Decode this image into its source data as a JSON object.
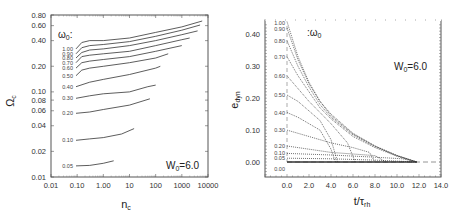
{
  "chart_data": [
    {
      "type": "line",
      "title": "",
      "xlabel": "n_c",
      "ylabel": "Ω_c",
      "xscale": "log",
      "yscale": "log",
      "xlim": [
        0.01,
        10000
      ],
      "ylim": [
        0.01,
        0.8
      ],
      "xticks": [
        "0.01",
        "0.10",
        "1.00",
        "10",
        "100",
        "1000",
        "10000"
      ],
      "yticks": [
        "0.01",
        "0.02",
        "0.04",
        "0.06",
        "0.08",
        "0.10",
        "0.20",
        "0.40",
        "0.60",
        "0.80"
      ],
      "legend_title": "ω0:",
      "annotation": "W0=6.0",
      "grid": false,
      "series": [
        {
          "name": "1.00",
          "x": [
            0.09,
            0.15,
            0.3,
            1,
            10,
            100,
            1000,
            6000
          ],
          "y": [
            0.32,
            0.38,
            0.4,
            0.4,
            0.43,
            0.5,
            0.58,
            0.68
          ]
        },
        {
          "name": "0.90",
          "x": [
            0.09,
            0.15,
            0.3,
            1,
            10,
            100,
            1000,
            5000
          ],
          "y": [
            0.28,
            0.33,
            0.35,
            0.36,
            0.39,
            0.45,
            0.53,
            0.61
          ]
        },
        {
          "name": "0.80",
          "x": [
            0.09,
            0.15,
            0.3,
            1,
            10,
            100,
            1000,
            4000
          ],
          "y": [
            0.25,
            0.29,
            0.31,
            0.32,
            0.35,
            0.4,
            0.47,
            0.52
          ]
        },
        {
          "name": "0.70",
          "x": [
            0.09,
            0.15,
            0.3,
            1,
            10,
            100,
            1000,
            2000
          ],
          "y": [
            0.22,
            0.26,
            0.27,
            0.28,
            0.3,
            0.35,
            0.41,
            0.43
          ]
        },
        {
          "name": "0.60",
          "x": [
            0.09,
            0.15,
            0.3,
            1,
            10,
            100,
            1000
          ],
          "y": [
            0.19,
            0.22,
            0.23,
            0.24,
            0.26,
            0.3,
            0.35
          ]
        },
        {
          "name": "0.50",
          "x": [
            0.09,
            0.15,
            0.3,
            1,
            10,
            100,
            300
          ],
          "y": [
            0.155,
            0.18,
            0.19,
            0.2,
            0.22,
            0.25,
            0.28
          ]
        },
        {
          "name": "0.40",
          "x": [
            0.09,
            0.3,
            1,
            10,
            100,
            150
          ],
          "y": [
            0.115,
            0.13,
            0.14,
            0.16,
            0.19,
            0.2
          ]
        },
        {
          "name": "0.30",
          "x": [
            0.09,
            0.3,
            1,
            10,
            50,
            100
          ],
          "y": [
            0.084,
            0.09,
            0.095,
            0.1,
            0.115,
            0.12
          ]
        },
        {
          "name": "0.20",
          "x": [
            0.09,
            0.3,
            1,
            10,
            60
          ],
          "y": [
            0.056,
            0.058,
            0.062,
            0.07,
            0.083
          ]
        },
        {
          "name": "0.10",
          "x": [
            0.09,
            0.3,
            1,
            5,
            15
          ],
          "y": [
            0.027,
            0.028,
            0.029,
            0.032,
            0.037
          ]
        },
        {
          "name": "0.05",
          "x": [
            0.09,
            0.3,
            1,
            2.5
          ],
          "y": [
            0.0135,
            0.0137,
            0.0145,
            0.0155
          ]
        }
      ]
    },
    {
      "type": "line",
      "title": "",
      "xlabel": "t/τ_rh",
      "ylabel": "e_dyn",
      "xlim": [
        -2,
        14
      ],
      "ylim": [
        -0.047,
        0.445
      ],
      "xticks": [
        "0.0",
        "2.0",
        "4.0",
        "6.0",
        "8.0",
        "10.0",
        "12.0",
        "14.0"
      ],
      "yticks": [
        "0.00",
        "0.10",
        "0.20",
        "0.30",
        "0.40"
      ],
      "legend_title": ":ω0",
      "annotation": "W0=6.0",
      "grid": false,
      "line_style": "dotted",
      "series": [
        {
          "name": "1.00",
          "x": [
            0,
            1,
            2,
            3,
            4,
            6,
            8,
            10,
            11.8
          ],
          "y": [
            0.44,
            0.33,
            0.25,
            0.19,
            0.15,
            0.09,
            0.05,
            0.02,
            0.0
          ]
        },
        {
          "name": "0.90",
          "x": [
            0,
            1,
            2,
            3,
            4,
            6,
            8,
            10,
            11.8
          ],
          "y": [
            0.42,
            0.32,
            0.245,
            0.19,
            0.145,
            0.088,
            0.05,
            0.02,
            0.0
          ]
        },
        {
          "name": "0.80",
          "x": [
            0,
            1,
            2,
            3,
            4,
            6,
            8,
            10,
            11.8
          ],
          "y": [
            0.38,
            0.3,
            0.235,
            0.18,
            0.14,
            0.085,
            0.048,
            0.02,
            0.0
          ]
        },
        {
          "name": "0.70",
          "x": [
            0,
            1,
            2,
            3,
            4,
            6,
            8,
            10,
            11.8
          ],
          "y": [
            0.33,
            0.27,
            0.22,
            0.17,
            0.135,
            0.08,
            0.045,
            0.018,
            0.0
          ]
        },
        {
          "name": "0.60",
          "x": [
            0,
            1,
            2,
            3,
            4,
            5.5,
            6.2
          ],
          "y": [
            0.27,
            0.23,
            0.19,
            0.155,
            0.12,
            0.06,
            0.0
          ]
        },
        {
          "name": "0.50",
          "x": [
            0,
            1,
            2,
            3,
            4,
            4.6
          ],
          "y": [
            0.21,
            0.19,
            0.16,
            0.13,
            0.07,
            0.0
          ]
        },
        {
          "name": "0.40",
          "x": [
            0,
            1,
            2,
            3,
            4,
            4.4
          ],
          "y": [
            0.155,
            0.14,
            0.12,
            0.1,
            0.04,
            0.0
          ]
        },
        {
          "name": "0.30",
          "x": [
            0,
            2,
            4,
            6,
            7.5,
            8.0
          ],
          "y": [
            0.1,
            0.08,
            0.06,
            0.045,
            0.03,
            0.0
          ]
        },
        {
          "name": "0.20",
          "x": [
            0,
            2,
            4,
            6,
            8,
            9.0
          ],
          "y": [
            0.05,
            0.04,
            0.03,
            0.025,
            0.02,
            0.0
          ]
        },
        {
          "name": "0.10",
          "x": [
            0,
            4,
            8,
            10.5,
            11.8
          ],
          "y": [
            0.027,
            0.022,
            0.015,
            0.01,
            0.0
          ]
        },
        {
          "name": "0.05",
          "x": [
            0,
            4,
            8,
            11.8
          ],
          "y": [
            0.012,
            0.01,
            0.006,
            0.0
          ]
        },
        {
          "name": "0.00",
          "x": [
            0,
            11.8
          ],
          "y": [
            0.0,
            0.0
          ]
        }
      ],
      "reference_lines": [
        {
          "orientation": "horizontal",
          "y": 0.0,
          "style": "dashed"
        },
        {
          "orientation": "vertical",
          "x": 0.0,
          "style": "dashed"
        }
      ]
    }
  ],
  "left": {
    "ylabel_main": "Ω",
    "ylabel_sub": "c",
    "xlabel_main": "n",
    "xlabel_sub": "c",
    "legend_main": "ω",
    "legend_sub": "0",
    "legend_suffix": ":",
    "ann_main": "W",
    "ann_sub": "0",
    "ann_suffix": "=6.0"
  },
  "right": {
    "ylabel_main": "e",
    "ylabel_sub": "dyn",
    "xlabel_main": "t/τ",
    "xlabel_sub": "rh",
    "legend_prefix": ":ω",
    "legend_sub": "0",
    "ann_main": "W",
    "ann_sub": "0",
    "ann_suffix": "=6.0"
  },
  "colors": {
    "line": "#333333",
    "axis": "#555555",
    "dashed": "#888888"
  }
}
